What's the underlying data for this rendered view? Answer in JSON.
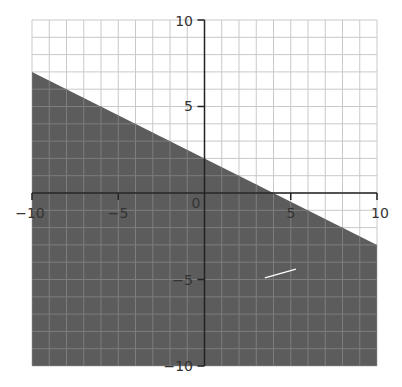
{
  "chart_data": {
    "type": "area",
    "title": "",
    "subtitle": "",
    "xlabel": "",
    "ylabel": "",
    "xlim": [
      -10,
      10
    ],
    "ylim": [
      -10,
      10
    ],
    "grid": true,
    "grid_step": 1,
    "x_ticks": [
      -10,
      -5,
      0,
      5,
      10
    ],
    "y_ticks": [
      -10,
      -5,
      5,
      10
    ],
    "x_tick_labels": [
      "−10",
      "−5",
      "0",
      "5",
      "10"
    ],
    "y_tick_labels": [
      "−10",
      "−5",
      "5",
      "10"
    ],
    "boundary_line": {
      "equation": "y = -0.5x + 2",
      "slope": -0.5,
      "intercept": 2,
      "style": "solid"
    },
    "inequality": "y ≤ -0.5x + 2",
    "shaded_region": "below",
    "boundary_points": [
      {
        "x": -10,
        "y": 7
      },
      {
        "x": 4,
        "y": 0
      },
      {
        "x": 10,
        "y": -3
      }
    ],
    "annotations": [
      {
        "type": "stray-line",
        "color": "#ffffff",
        "approx_from": {
          "x": 3.5,
          "y": -4.9
        },
        "approx_to": {
          "x": 5.3,
          "y": -4.4
        }
      }
    ],
    "legend": null
  },
  "colors": {
    "shade": "#5c5c5c",
    "grid_light": "#c9c9c9",
    "grid_dark": "#7d7d7d",
    "axis": "#222222",
    "background": "#ffffff"
  },
  "labels": {
    "x": {
      "m10": "−10",
      "m5": "−5",
      "zero": "0",
      "p5": "5",
      "p10": "10"
    },
    "y": {
      "m10": "−10",
      "m5": "−5",
      "p5": "5",
      "p10": "10"
    }
  }
}
